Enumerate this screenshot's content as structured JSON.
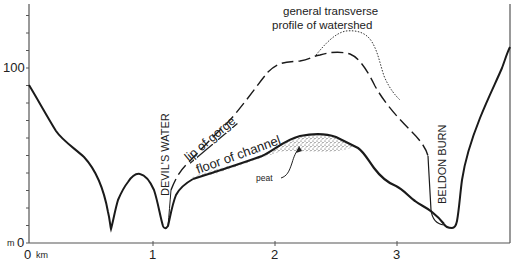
{
  "figure": {
    "title_line1": "general transverse",
    "title_line2": "profile of watershed",
    "y_axis": {
      "unit": "m",
      "labels": [
        {
          "value": 0,
          "text": "0"
        },
        {
          "value": 100,
          "text": "100"
        }
      ],
      "tick_interval": 10,
      "range": [
        0,
        130
      ]
    },
    "x_axis": {
      "unit": "km",
      "labels": [
        {
          "value": 0,
          "text": "0"
        },
        {
          "value": 1,
          "text": "1"
        },
        {
          "value": 2,
          "text": "2"
        },
        {
          "value": 3,
          "text": "3"
        }
      ],
      "range": [
        0,
        3.9
      ]
    },
    "labels": {
      "devils_water": "DEVIL'S WATER",
      "beldon_burn": "BELDON BURN",
      "lip_of_gorge": "lip  of  gorge",
      "floor_of_channel": "floor  of  channel",
      "peat": "peat",
      "unit_m": "m",
      "unit_km": "km"
    },
    "legend": [
      {
        "name": "ground surface profile",
        "style": "solid"
      },
      {
        "name": "lip of gorge",
        "style": "dashed"
      },
      {
        "name": "general transverse profile of watershed",
        "style": "dotted"
      },
      {
        "name": "peat",
        "style": "stippled"
      }
    ],
    "colors": {
      "line": "#1a1a1a",
      "axis": "#555555",
      "text": "#222222",
      "background": "#ffffff"
    }
  }
}
